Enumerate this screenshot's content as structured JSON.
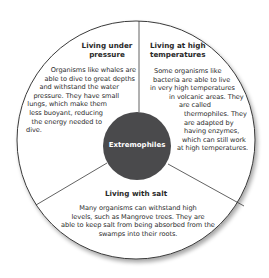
{
  "diagram": {
    "title": "Extremophiles",
    "colors": {
      "outer_fill": "#ffffff",
      "outer_stroke": "#3a3a3a",
      "center_fill": "#4a4a4c",
      "center_text": "#ffffff",
      "text": "#2b2b2b"
    },
    "sections": [
      {
        "id": "pressure",
        "heading_lines": [
          "Living under",
          "pressure"
        ],
        "body_lines": [
          "Organisms like whales are",
          "able to dive to great depths",
          "and withstand the water",
          "pressure. They have small",
          "lungs, which make them",
          "less buoyant, reducing",
          "the energy needed to",
          "dive."
        ]
      },
      {
        "id": "high-temperatures",
        "heading_lines": [
          "Living at high",
          "temperatures"
        ],
        "body_lines": [
          "Some organisms like",
          "bacteria are able to live",
          "in very high temperatures",
          "in volcanic areas. They",
          "are called",
          "thermophiles. They",
          "are adapted by",
          "having enzymes,",
          "which can still work",
          "at high temperatures."
        ]
      },
      {
        "id": "salt",
        "heading_lines": [
          "Living with salt"
        ],
        "body_lines": [
          "Many organisms can withstand high",
          "levels, such as Mangrove trees. They are",
          "able to keep salt from being absorbed from the",
          "swamps into their roots."
        ]
      }
    ]
  }
}
